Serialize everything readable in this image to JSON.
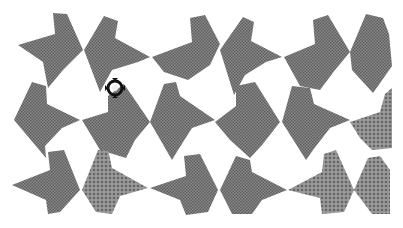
{
  "image": {
    "description": "Halftone gray tessellation of arrow / bowtie shaped tiles on white background",
    "width": 403,
    "height": 228,
    "colors": {
      "background": "#ffffff",
      "tile_dark": "#7a7a7a",
      "tile_light": "#8c8c8c",
      "cursor": "#111111"
    },
    "tiles": [
      {
        "id": "t1",
        "fill": "tile_dark",
        "points": "18,45 55,34 53,13 67,14 83,50 63,70 48,88 43,62"
      },
      {
        "id": "t2",
        "fill": "tile_dark",
        "points": "84,50 104,16 118,21 115,38 150,57 138,62 112,70 100,92"
      },
      {
        "id": "t3",
        "fill": "tile_dark",
        "points": "152,57 192,42 190,18 205,15 220,44 210,65 188,80 164,72"
      },
      {
        "id": "t4",
        "fill": "tile_dark",
        "points": "220,50 243,17 254,22 251,41 282,57 266,62 245,75 234,95"
      },
      {
        "id": "t5",
        "fill": "tile_dark",
        "points": "284,57 315,44 313,20 328,15 350,52 335,70 320,90 300,86"
      },
      {
        "id": "t6",
        "fill": "tile_dark",
        "points": "350,52 366,14 383,18 389,34 392,66 378,86 373,93 352,70"
      },
      {
        "id": "t7",
        "fill": "tile_dark",
        "points": "14,120 32,82 46,86 47,104 80,120 62,128 45,146 46,158"
      },
      {
        "id": "t8",
        "fill": "tile_dark",
        "points": "82,120 108,112 108,96 124,84 150,122 135,140 126,158 100,150"
      },
      {
        "id": "t9",
        "fill": "tile_dark",
        "points": "150,122 164,84 176,82 180,96 215,120 192,128 178,150 172,160"
      },
      {
        "id": "t10",
        "fill": "tile_dark",
        "points": "215,122 236,106 236,86 255,82 280,122 262,145 250,158 230,140"
      },
      {
        "id": "t11",
        "fill": "tile_dark",
        "points": "282,122 292,86 310,88 314,104 350,120 330,128 313,150 306,160"
      },
      {
        "id": "t12",
        "fill": "tile_light",
        "points": "350,122 380,112 385,94 392,88 392,148 372,150 360,138"
      },
      {
        "id": "t13",
        "fill": "tile_dark",
        "points": "12,185 50,170 48,152 64,150 80,190 60,212 48,214 46,200"
      },
      {
        "id": "t14",
        "fill": "tile_light",
        "points": "82,190 98,150 108,150 112,168 148,188 120,196 112,214 96,212"
      },
      {
        "id": "t15",
        "fill": "tile_dark",
        "points": "150,188 186,176 184,156 200,154 218,190 208,212 186,215 180,200"
      },
      {
        "id": "t16",
        "fill": "tile_dark",
        "points": "220,190 236,156 250,160 252,172 287,190 262,200 252,214 232,214"
      },
      {
        "id": "t17",
        "fill": "tile_light",
        "points": "288,190 322,172 324,154 336,150 354,190 344,212 322,214 320,198"
      },
      {
        "id": "t18",
        "fill": "tile_light",
        "points": "354,190 368,158 380,156 390,170 390,214 372,214"
      }
    ],
    "cursor": {
      "name": "move-cursor",
      "x": 104,
      "y": 78
    }
  }
}
